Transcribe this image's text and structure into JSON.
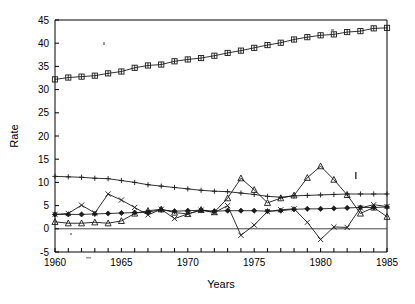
{
  "chart_data": {
    "type": "line",
    "title": "",
    "xlabel": "Years",
    "ylabel": "Rate",
    "xlim": [
      1960,
      1985
    ],
    "ylim": [
      -5,
      45
    ],
    "xticks": [
      1960,
      1961,
      1962,
      1963,
      1964,
      1965,
      1966,
      1967,
      1968,
      1969,
      1970,
      1971,
      1972,
      1973,
      1974,
      1975,
      1976,
      1977,
      1978,
      1979,
      1980,
      1981,
      1982,
      1983,
      1984,
      1985
    ],
    "xtick_labels": [
      "1960",
      "1965",
      "1970",
      "1975",
      "1980",
      "1985"
    ],
    "xtick_label_values": [
      1960,
      1965,
      1970,
      1975,
      1980,
      1985
    ],
    "yticks": [
      -5,
      0,
      5,
      10,
      15,
      20,
      25,
      30,
      35,
      40,
      45
    ],
    "ytick_labels": [
      "-5",
      "0",
      "5",
      "10",
      "15",
      "20",
      "25",
      "30",
      "35",
      "40",
      "45"
    ],
    "grid": false,
    "legend": "none",
    "zero_reference_line": 0,
    "x": [
      1960,
      1961,
      1962,
      1963,
      1964,
      1965,
      1966,
      1967,
      1968,
      1969,
      1970,
      1971,
      1972,
      1973,
      1974,
      1975,
      1976,
      1977,
      1978,
      1979,
      1980,
      1981,
      1982,
      1983,
      1984,
      1985
    ],
    "series": [
      {
        "name": "series-squares",
        "marker": "square",
        "values": [
          32.2,
          32.6,
          32.8,
          33.0,
          33.5,
          33.9,
          34.7,
          35.2,
          35.4,
          36.1,
          36.5,
          36.8,
          37.3,
          37.9,
          38.4,
          39.0,
          39.6,
          40.1,
          40.8,
          41.3,
          41.7,
          41.9,
          42.4,
          42.6,
          43.2,
          43.3
        ]
      },
      {
        "name": "series-plus",
        "marker": "plus",
        "values": [
          11.3,
          11.2,
          11.1,
          10.9,
          10.8,
          10.4,
          10.0,
          9.5,
          9.2,
          8.9,
          8.6,
          8.3,
          8.1,
          8.0,
          7.7,
          7.4,
          7.0,
          6.8,
          7.1,
          7.2,
          7.3,
          7.4,
          7.5,
          7.5,
          7.5,
          7.5
        ]
      },
      {
        "name": "series-triangles",
        "marker": "triangle",
        "values": [
          1.5,
          1.2,
          1.2,
          1.4,
          1.2,
          1.7,
          3.3,
          3.9,
          4.2,
          3.5,
          3.2,
          4.1,
          3.6,
          6.6,
          10.9,
          8.4,
          5.6,
          6.6,
          7.2,
          11.0,
          13.5,
          10.6,
          7.3,
          3.3,
          4.6,
          2.6
        ]
      },
      {
        "name": "series-x",
        "marker": "x",
        "values": [
          3.1,
          3.3,
          5.1,
          3.4,
          7.5,
          6.2,
          4.6,
          3.0,
          4.2,
          2.2,
          3.2,
          4.0,
          3.5,
          5.0,
          -1.4,
          0.8,
          3.7,
          4.1,
          4.3,
          1.4,
          -2.3,
          0.4,
          0.3,
          4.5,
          5.2,
          4.8
        ]
      },
      {
        "name": "series-diamonds",
        "marker": "diamond",
        "values": [
          3.1,
          3.1,
          3.1,
          3.2,
          3.3,
          3.4,
          3.5,
          3.6,
          4.1,
          3.8,
          3.9,
          4.0,
          3.8,
          3.9,
          3.9,
          3.9,
          3.8,
          3.9,
          4.2,
          4.3,
          4.3,
          4.4,
          4.5,
          4.6,
          4.6,
          4.7
        ]
      }
    ]
  },
  "artifacts": {
    "stray_mark_label": "stray-ink-mark"
  }
}
